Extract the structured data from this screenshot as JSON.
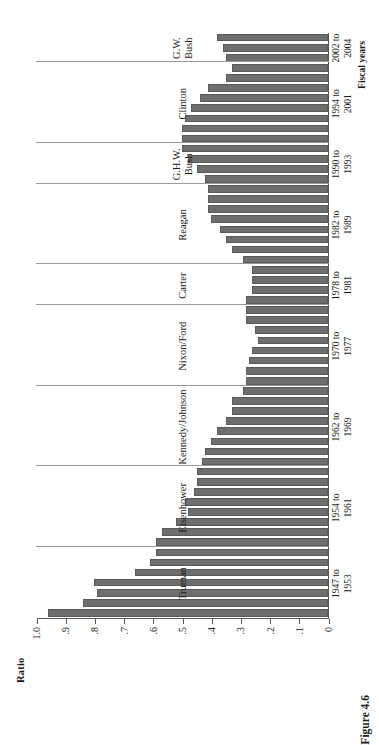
{
  "figure": {
    "caption": "Figure 4.6",
    "rotation_degrees": -90
  },
  "chart_data": {
    "type": "bar",
    "orientation": "vertical-rendered-rotated",
    "title": "",
    "xlabel": "Fiscal years",
    "ylabel": "Ratio",
    "ylim": [
      0,
      1.0
    ],
    "grid": false,
    "legend": null,
    "ytick_labels": [
      "1.0",
      ".9",
      ".8",
      ".7",
      ".6",
      ".5",
      ".4",
      ".3",
      ".2",
      ".1",
      "0"
    ],
    "ytick_values": [
      1.0,
      0.9,
      0.8,
      0.7,
      0.6,
      0.5,
      0.4,
      0.3,
      0.2,
      0.1,
      0
    ],
    "bar_color": "#6e6e6e",
    "separator_color": "#9a9a9a",
    "axis_color": "#555555",
    "categories": [
      "1947",
      "1948",
      "1949",
      "1950",
      "1951",
      "1952",
      "1953",
      "1954",
      "1955",
      "1956",
      "1957",
      "1958",
      "1959",
      "1960",
      "1961",
      "1962",
      "1963",
      "1964",
      "1965",
      "1966",
      "1967",
      "1968",
      "1969",
      "1970",
      "1971",
      "1972",
      "1973",
      "1974",
      "1975",
      "1976",
      "1977",
      "1978",
      "1979",
      "1980",
      "1981",
      "1982",
      "1983",
      "1984",
      "1985",
      "1986",
      "1987",
      "1988",
      "1989",
      "1990",
      "1991",
      "1992",
      "1993",
      "1994",
      "1995",
      "1996",
      "1997",
      "1998",
      "1999",
      "2000",
      "2001",
      "2002",
      "2003",
      "2004"
    ],
    "values": [
      0.96,
      0.84,
      0.79,
      0.8,
      0.66,
      0.61,
      0.59,
      0.59,
      0.57,
      0.52,
      0.48,
      0.49,
      0.46,
      0.45,
      0.45,
      0.43,
      0.42,
      0.4,
      0.38,
      0.35,
      0.33,
      0.33,
      0.29,
      0.28,
      0.28,
      0.27,
      0.26,
      0.24,
      0.25,
      0.28,
      0.28,
      0.28,
      0.26,
      0.26,
      0.26,
      0.29,
      0.33,
      0.35,
      0.37,
      0.4,
      0.41,
      0.41,
      0.41,
      0.42,
      0.45,
      0.48,
      0.5,
      0.5,
      0.5,
      0.49,
      0.47,
      0.44,
      0.41,
      0.35,
      0.33,
      0.35,
      0.36,
      0.38
    ],
    "administrations": [
      {
        "name": "Truman",
        "label": "Truman",
        "years": "1947 to\n1953",
        "start": "1947",
        "end": "1953"
      },
      {
        "name": "Eisenhower",
        "label": "Eisenhower",
        "years": "1954 to\n1961",
        "start": "1954",
        "end": "1961"
      },
      {
        "name": "Kennedy/Johnson",
        "label": "Kennedy/Johnson",
        "years": "1962 to\n1969",
        "start": "1962",
        "end": "1969"
      },
      {
        "name": "Nixon/Ford",
        "label": "Nixon/Ford",
        "years": "1970 to\n1977",
        "start": "1970",
        "end": "1977"
      },
      {
        "name": "Carter",
        "label": "Carter",
        "years": "1978 to\n1981",
        "start": "1978",
        "end": "1981"
      },
      {
        "name": "Reagan",
        "label": "Reagan",
        "years": "1982 to\n1989",
        "start": "1982",
        "end": "1989"
      },
      {
        "name": "GHW Bush",
        "label": "G.H.W.\nBush",
        "years": "1990 to\n1993",
        "start": "1990",
        "end": "1993"
      },
      {
        "name": "Clinton",
        "label": "Clinton",
        "years": "1994 to\n2001",
        "start": "1994",
        "end": "2001"
      },
      {
        "name": "GW Bush",
        "label": "G.W.\nBush",
        "years": "2002 to\n2004",
        "start": "2002",
        "end": "2004"
      }
    ]
  }
}
